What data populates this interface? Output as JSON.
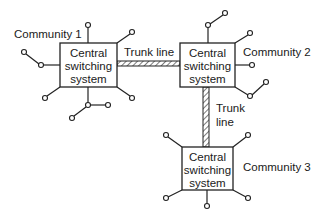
{
  "diagram": {
    "communities": [
      {
        "id": "community-1",
        "label": "Community 1",
        "box": [
          "Central",
          "switching",
          "system"
        ]
      },
      {
        "id": "community-2",
        "label": "Community 2",
        "box": [
          "Central",
          "switching",
          "system"
        ]
      },
      {
        "id": "community-3",
        "label": "Community 3",
        "box": [
          "Central",
          "switching",
          "system"
        ]
      }
    ],
    "trunks": [
      {
        "id": "trunk-1-2",
        "label": [
          "Trunk line"
        ],
        "from": "community-1",
        "to": "community-2"
      },
      {
        "id": "trunk-2-3",
        "label": [
          "Trunk",
          "line"
        ],
        "from": "community-2",
        "to": "community-3"
      }
    ],
    "colors": {
      "line": "#222222",
      "background": "#ffffff"
    }
  }
}
